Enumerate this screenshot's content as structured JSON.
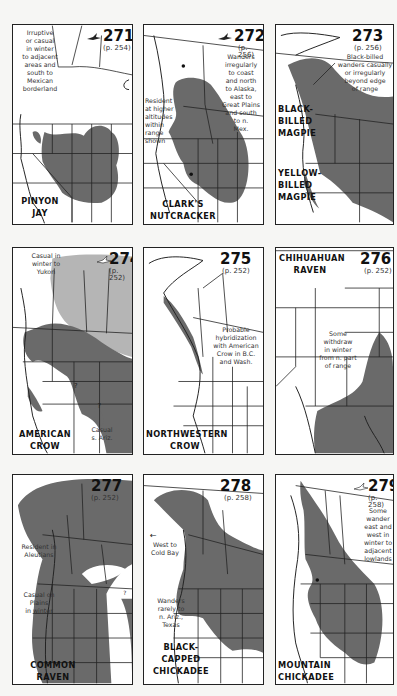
{
  "page": {
    "colors": {
      "range_dark": "#6a6a6a",
      "range_light": "#b5b5b5",
      "border": "#222222",
      "background": "#ffffff"
    }
  },
  "maps": [
    {
      "number": "271",
      "page_ref": "(p. 254)",
      "name_line1": "PINYON",
      "name_line2": "JAY",
      "notes": [
        "Irruptive",
        "or casual",
        "in winter",
        "to adjacent",
        "areas and",
        "south to",
        "Mexican",
        "borderland"
      ]
    },
    {
      "number": "272",
      "page_ref": "(p. 256)",
      "name_line1": "CLARK'S",
      "name_line2": "NUTCRACKER",
      "notes": [
        "Wanders",
        "irregularly",
        "to coast",
        "and north",
        "to Alaska,",
        "east to",
        "Great Plains",
        "and south",
        "to n.",
        "Mex."
      ],
      "notes2": [
        "Resident",
        "at higher",
        "altitudes",
        "within",
        "range",
        "shown"
      ]
    },
    {
      "number": "273",
      "page_ref": "(p. 256)",
      "name_a_line1": "BLACK-",
      "name_a_line2": "BILLED",
      "name_a_line3": "MAGPIE",
      "name_b_line1": "YELLOW-",
      "name_b_line2": "BILLED",
      "name_b_line3": "MAGPIE",
      "notes": [
        "Black-billed",
        "wanders casually",
        "or irregularly",
        "beyond edge",
        "of range"
      ]
    },
    {
      "number": "274",
      "page_ref": "(p. 252)",
      "name_line1": "AMERICAN",
      "name_line2": "CROW",
      "notes": [
        "Casual in",
        "winter to",
        "Yukon"
      ],
      "notes2": [
        "Casual",
        "s. Ariz."
      ],
      "question_marks": [
        "?",
        "?"
      ]
    },
    {
      "number": "275",
      "page_ref": "(p. 252)",
      "name_line1": "NORTHWESTERN",
      "name_line2": "CROW",
      "notes": [
        "Probable",
        "hybridization",
        "with American",
        "Crow in B.C.",
        "and Wash."
      ]
    },
    {
      "number": "276",
      "page_ref": "(p. 252)",
      "name_line1": "CHIHUAHUAN",
      "name_line2": "RAVEN",
      "notes": [
        "Some",
        "withdraw",
        "in winter",
        "from n. part",
        "of range"
      ]
    },
    {
      "number": "277",
      "page_ref": "(p. 252)",
      "name_line1": "COMMON",
      "name_line2": "RAVEN",
      "notes": [
        "Resident in",
        "Aleutians"
      ],
      "notes2": [
        "Casual on",
        "Plains",
        "in winter"
      ],
      "question_marks": [
        "?"
      ]
    },
    {
      "number": "278",
      "page_ref": "(p. 258)",
      "name_line1": "BLACK-",
      "name_line2": "CAPPED",
      "name_line3": "CHICKADEE",
      "notes": [
        "West to",
        "Cold Bay"
      ],
      "notes2": [
        "Wanders",
        "rarely to",
        "n. Ariz.,",
        "Texas"
      ]
    },
    {
      "number": "279",
      "page_ref": "(p. 258)",
      "name_line1": "MOUNTAIN",
      "name_line2": "CHICKADEE",
      "notes": [
        "Some",
        "wander",
        "east and",
        "west in",
        "winter to",
        "adjacent",
        "lowlands"
      ]
    }
  ]
}
